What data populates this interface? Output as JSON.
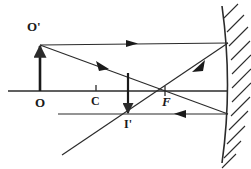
{
  "figure": {
    "type": "optics-ray-diagram",
    "stroke_color": "#2b2b2b",
    "background_color": "#ffffff"
  },
  "labels": {
    "object_top": "O'",
    "object_base": "O",
    "center_of_curvature": "C",
    "focus": "F",
    "image_top": "I'"
  },
  "geometry": {
    "principal_axis": {
      "x1": 8,
      "y1": 91,
      "x2": 228,
      "y2": 91
    },
    "mirror": {
      "x": 228,
      "top_y": 6,
      "bottom_y": 163,
      "curve_bulge": 5
    },
    "object_arrow": {
      "x": 40,
      "base_y": 91,
      "tip_y": 45
    },
    "image_arrow": {
      "x": 128,
      "base_y": 75,
      "tip_y": 115
    },
    "point_C": {
      "x": 96,
      "y": 91
    },
    "point_F": {
      "x": 165,
      "y": 91
    },
    "point_I": {
      "x": 128,
      "y": 115
    },
    "incident_parallel_ray": {
      "x1": 40,
      "y1": 45,
      "x2": 228,
      "y2": 43
    },
    "reflected_through_focus_ray": {
      "x1": 228,
      "y1": 43,
      "x2": 62,
      "y2": 155
    },
    "incident_through_focus_ray": {
      "x1": 40,
      "y1": 45,
      "x2": 228,
      "y2": 114
    },
    "reflected_parallel_ray": {
      "x1": 228,
      "y1": 114,
      "x2": 58,
      "y2": 114
    },
    "arrowheads": [
      {
        "name": "top-ray-arrow",
        "x": 133,
        "y": 43,
        "direction": "right"
      },
      {
        "name": "oblique-ray-arrow",
        "x": 103,
        "y": 67,
        "direction": "down-right"
      },
      {
        "name": "reflected-focus-ray-arrow",
        "x": 198,
        "y": 67,
        "direction": "down-left"
      },
      {
        "name": "reflected-parallel-ray-arrow",
        "x": 178,
        "y": 114,
        "direction": "left"
      }
    ],
    "hatch_count": 11
  }
}
